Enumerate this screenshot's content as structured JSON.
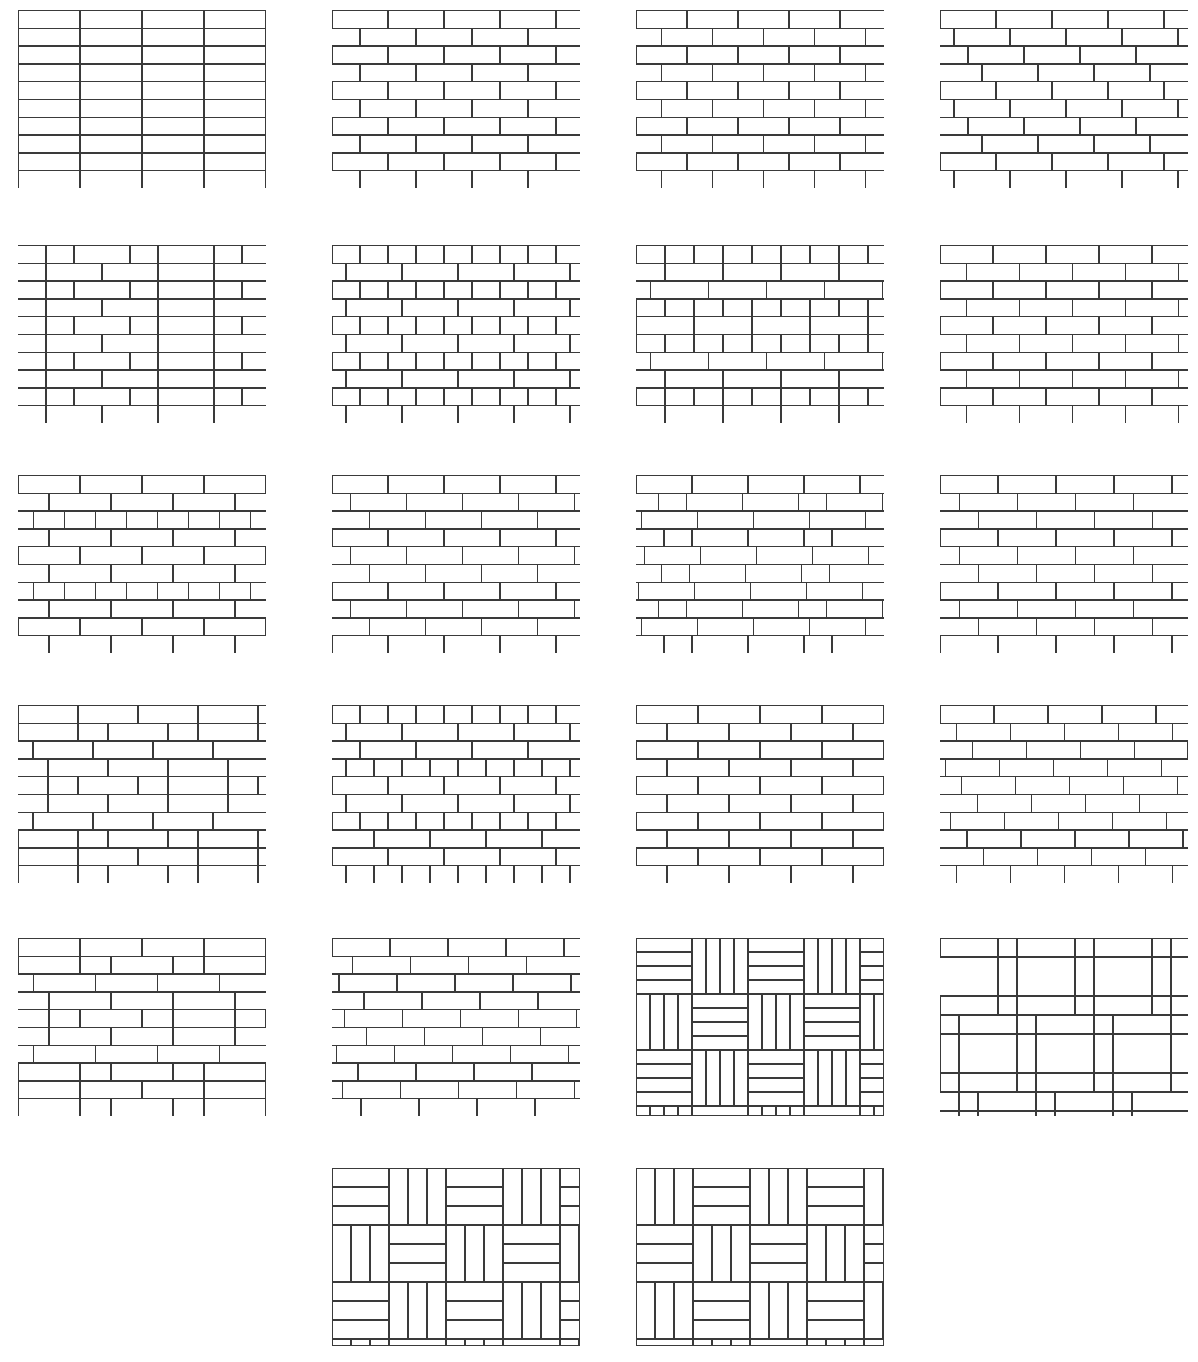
{
  "plate": {
    "title": "Masonry Bond and Paving Pattern Reference Plate",
    "background_color": "#ffffff",
    "line_color": "#3a3a3a",
    "width": 1198,
    "height": 1362,
    "columns": 4,
    "rows": 6,
    "panel_count": 22
  },
  "panels": [
    {
      "index": 1,
      "name": "stack-bond",
      "label": "Stack bond",
      "x": 18,
      "y": 10,
      "w": 248,
      "h": 178,
      "kind": "courses",
      "unit_w": 62,
      "unit_h": 17.8,
      "offsets": [
        0,
        0,
        0,
        0,
        0,
        0,
        0,
        0,
        0,
        0
      ],
      "row_kinds": [
        "stretcher",
        "stretcher",
        "stretcher",
        "stretcher",
        "stretcher",
        "stretcher",
        "stretcher",
        "stretcher",
        "stretcher",
        "stretcher"
      ]
    },
    {
      "index": 2,
      "name": "running-bond-half",
      "label": "Running bond, half lap",
      "x": 332,
      "y": 10,
      "w": 248,
      "h": 178,
      "kind": "courses",
      "unit_w": 56,
      "unit_h": 17.8,
      "offsets": [
        0,
        0.5,
        0,
        0.5,
        0,
        0.5,
        0,
        0.5,
        0,
        0.5
      ],
      "row_kinds": [
        "stretcher",
        "stretcher",
        "stretcher",
        "stretcher",
        "stretcher",
        "stretcher",
        "stretcher",
        "stretcher",
        "stretcher",
        "stretcher"
      ]
    },
    {
      "index": 3,
      "name": "running-bond-half-narrow",
      "label": "Running bond, half lap, narrow unit",
      "x": 636,
      "y": 10,
      "w": 248,
      "h": 178,
      "kind": "courses",
      "unit_w": 51,
      "unit_h": 17.8,
      "offsets": [
        0,
        0.5,
        0,
        0.5,
        0,
        0.5,
        0,
        0.5,
        0,
        0.5
      ],
      "row_kinds": [
        "stretcher",
        "stretcher",
        "stretcher",
        "stretcher",
        "stretcher",
        "stretcher",
        "stretcher",
        "stretcher",
        "stretcher",
        "stretcher"
      ]
    },
    {
      "index": 4,
      "name": "raking-stretcher-bond-quarter",
      "label": "Raking stretcher bond, quarter lap",
      "x": 940,
      "y": 10,
      "w": 248,
      "h": 178,
      "kind": "courses",
      "unit_w": 56,
      "unit_h": 17.8,
      "offsets": [
        0,
        0.25,
        0.5,
        0.75,
        0,
        0.25,
        0.5,
        0.75,
        0,
        0.25
      ],
      "row_kinds": [
        "stretcher",
        "stretcher",
        "stretcher",
        "stretcher",
        "stretcher",
        "stretcher",
        "stretcher",
        "stretcher",
        "stretcher",
        "stretcher"
      ]
    },
    {
      "index": 5,
      "name": "flemish-bond",
      "label": "Flemish bond",
      "x": 18,
      "y": 245,
      "w": 248,
      "h": 178,
      "kind": "courses",
      "unit_w": 56,
      "unit_h": 17.8,
      "offsets": [
        0,
        0.5,
        0,
        0.5,
        0,
        0.5,
        0,
        0.5,
        0,
        0.5
      ],
      "row_kinds": [
        "flemish",
        "stretcher",
        "flemish",
        "stretcher",
        "flemish",
        "stretcher",
        "flemish",
        "stretcher",
        "flemish",
        "stretcher"
      ]
    },
    {
      "index": 6,
      "name": "english-cross-bond",
      "label": "English cross bond",
      "x": 332,
      "y": 245,
      "w": 248,
      "h": 178,
      "kind": "courses",
      "unit_w": 56,
      "unit_h": 17.8,
      "offsets": [
        0,
        0.25,
        0,
        0.25,
        0,
        0.25,
        0,
        0.25,
        0,
        0.25
      ],
      "row_kinds": [
        "header",
        "stretcher",
        "header",
        "stretcher",
        "header",
        "stretcher",
        "header",
        "stretcher",
        "header",
        "stretcher"
      ]
    },
    {
      "index": 7,
      "name": "english-bond",
      "label": "English bond",
      "x": 636,
      "y": 245,
      "w": 248,
      "h": 178,
      "kind": "courses",
      "unit_w": 58,
      "unit_h": 17.8,
      "offsets": [
        0,
        0.5,
        0.25,
        0.5,
        0,
        0.5,
        0.25,
        0.5,
        0,
        0.5
      ],
      "row_kinds": [
        "header",
        "stretcher",
        "stretcher",
        "header",
        "stretcher",
        "header",
        "stretcher",
        "stretcher",
        "header",
        "stretcher"
      ]
    },
    {
      "index": 8,
      "name": "running-bond-half-alt",
      "label": "Running bond, half lap variant",
      "x": 940,
      "y": 245,
      "w": 248,
      "h": 178,
      "kind": "courses",
      "unit_w": 53,
      "unit_h": 17.8,
      "offsets": [
        0,
        0.5,
        0,
        0.5,
        0,
        0.5,
        0,
        0.5,
        0,
        0.5
      ],
      "row_kinds": [
        "stretcher",
        "stretcher",
        "stretcher",
        "stretcher",
        "stretcher",
        "stretcher",
        "stretcher",
        "stretcher",
        "stretcher",
        "stretcher"
      ]
    },
    {
      "index": 9,
      "name": "english-garden-wall-bond",
      "label": "English garden wall bond",
      "x": 18,
      "y": 475,
      "w": 248,
      "h": 178,
      "kind": "courses",
      "unit_w": 62,
      "unit_h": 17.8,
      "offsets": [
        0,
        0.5,
        0.25,
        0.5,
        0,
        0.5,
        0.25,
        0.5,
        0,
        0.5
      ],
      "row_kinds": [
        "stretcher",
        "stretcher",
        "header",
        "stretcher",
        "stretcher",
        "stretcher",
        "header",
        "stretcher",
        "stretcher",
        "stretcher"
      ]
    },
    {
      "index": 10,
      "name": "running-bond-third",
      "label": "Running bond, third lap",
      "x": 332,
      "y": 475,
      "w": 248,
      "h": 178,
      "kind": "courses",
      "unit_w": 56,
      "unit_h": 17.8,
      "offsets": [
        0,
        0.333,
        0.666,
        0,
        0.333,
        0.666,
        0,
        0.333,
        0.666,
        0
      ],
      "row_kinds": [
        "stretcher",
        "stretcher",
        "stretcher",
        "stretcher",
        "stretcher",
        "stretcher",
        "stretcher",
        "stretcher",
        "stretcher",
        "stretcher"
      ]
    },
    {
      "index": 11,
      "name": "monk-bond",
      "label": "Monk bond",
      "x": 636,
      "y": 475,
      "w": 248,
      "h": 178,
      "kind": "courses",
      "unit_w": 56,
      "unit_h": 17.8,
      "offsets": [
        0,
        0.4,
        0.1,
        0.5,
        0.15,
        0.45,
        0.05,
        0.4,
        0.1,
        0.5
      ],
      "row_kinds": [
        "stretcher",
        "mixed",
        "stretcher",
        "mixed",
        "stretcher",
        "mixed",
        "stretcher",
        "mixed",
        "stretcher",
        "mixed"
      ]
    },
    {
      "index": 12,
      "name": "raking-bond-third",
      "label": "Raking bond, third lap",
      "x": 940,
      "y": 475,
      "w": 248,
      "h": 178,
      "kind": "courses",
      "unit_w": 58,
      "unit_h": 17.8,
      "offsets": [
        0,
        0.333,
        0.666,
        0,
        0.333,
        0.666,
        0,
        0.333,
        0.666,
        0
      ],
      "row_kinds": [
        "stretcher",
        "stretcher",
        "stretcher",
        "stretcher",
        "stretcher",
        "stretcher",
        "stretcher",
        "stretcher",
        "stretcher",
        "stretcher"
      ]
    },
    {
      "index": 13,
      "name": "flemish-garden-wall-bond",
      "label": "Flemish garden wall bond",
      "x": 18,
      "y": 705,
      "w": 248,
      "h": 178,
      "kind": "courses",
      "unit_w": 60,
      "unit_h": 17.8,
      "offsets": [
        0,
        0.5,
        0.25,
        0.5,
        0,
        0.5,
        0.25,
        0.5,
        0,
        0.5
      ],
      "row_kinds": [
        "stretcher",
        "flemish",
        "stretcher",
        "stretcher",
        "flemish",
        "stretcher",
        "stretcher",
        "flemish",
        "stretcher",
        "flemish"
      ]
    },
    {
      "index": 14,
      "name": "dutch-bond",
      "label": "Dutch bond",
      "x": 332,
      "y": 705,
      "w": 248,
      "h": 178,
      "kind": "courses",
      "unit_w": 56,
      "unit_h": 17.8,
      "offsets": [
        0,
        0.25,
        0.5,
        0.75,
        0,
        0.25,
        0.5,
        0.75,
        0,
        0.25
      ],
      "row_kinds": [
        "header",
        "stretcher",
        "stretcher",
        "header",
        "stretcher",
        "stretcher",
        "header",
        "stretcher",
        "stretcher",
        "header"
      ]
    },
    {
      "index": 15,
      "name": "running-bond-wide-unit",
      "label": "Running bond, wide unit",
      "x": 636,
      "y": 705,
      "w": 248,
      "h": 178,
      "kind": "courses",
      "unit_w": 62,
      "unit_h": 17.8,
      "offsets": [
        0,
        0.5,
        0,
        0.5,
        0,
        0.5,
        0,
        0.5,
        0,
        0.5
      ],
      "row_kinds": [
        "stretcher",
        "stretcher",
        "stretcher",
        "stretcher",
        "stretcher",
        "stretcher",
        "stretcher",
        "stretcher",
        "stretcher",
        "stretcher"
      ]
    },
    {
      "index": 16,
      "name": "staggered-raking-bond",
      "label": "Staggered raking bond",
      "x": 940,
      "y": 705,
      "w": 248,
      "h": 178,
      "kind": "courses",
      "unit_w": 54,
      "unit_h": 17.8,
      "offsets": [
        0,
        0.3,
        0.6,
        0.1,
        0.4,
        0.7,
        0.2,
        0.5,
        0.8,
        0.3
      ],
      "row_kinds": [
        "stretcher",
        "stretcher",
        "stretcher",
        "stretcher",
        "stretcher",
        "stretcher",
        "stretcher",
        "stretcher",
        "stretcher",
        "stretcher"
      ]
    },
    {
      "index": 17,
      "name": "common-bond",
      "label": "Common bond",
      "x": 18,
      "y": 938,
      "w": 248,
      "h": 178,
      "kind": "courses",
      "unit_w": 62,
      "unit_h": 17.8,
      "offsets": [
        0,
        0.5,
        0.25,
        0.5,
        0,
        0.5,
        0.25,
        0.5,
        0,
        0.5
      ],
      "row_kinds": [
        "stretcher",
        "flemish",
        "stretcher",
        "stretcher",
        "flemish",
        "stretcher",
        "stretcher",
        "flemish",
        "stretcher",
        "flemish"
      ]
    },
    {
      "index": 18,
      "name": "irregular-running-bond",
      "label": "Irregular running bond",
      "x": 332,
      "y": 938,
      "w": 248,
      "h": 178,
      "kind": "courses",
      "unit_w": 58,
      "unit_h": 17.8,
      "offsets": [
        0,
        0.35,
        0.12,
        0.55,
        0.22,
        0.6,
        0.08,
        0.45,
        0.18,
        0.5
      ],
      "row_kinds": [
        "stretcher",
        "stretcher",
        "stretcher",
        "stretcher",
        "stretcher",
        "stretcher",
        "stretcher",
        "stretcher",
        "stretcher",
        "stretcher"
      ]
    },
    {
      "index": 19,
      "name": "basketweave-pattern",
      "label": "Basket weave",
      "x": 636,
      "y": 938,
      "w": 248,
      "h": 178,
      "kind": "basketweave",
      "block": 56,
      "strips": 4
    },
    {
      "index": 20,
      "name": "herringbone-pattern",
      "label": "Herringbone",
      "x": 940,
      "y": 938,
      "w": 248,
      "h": 178,
      "kind": "herringbone",
      "brick_len": 58,
      "brick_wid": 19
    },
    {
      "index": 21,
      "name": "double-basketweave-pattern",
      "label": "Double basket weave",
      "x": 332,
      "y": 1168,
      "w": 248,
      "h": 178,
      "kind": "pinwheel",
      "block": 56,
      "strips": 3,
      "variant": "a"
    },
    {
      "index": 22,
      "name": "pinwheel-basketweave-pattern",
      "label": "Pinwheel basket weave",
      "x": 636,
      "y": 1168,
      "w": 248,
      "h": 178,
      "kind": "pinwheel",
      "block": 56,
      "strips": 3,
      "variant": "b"
    }
  ]
}
